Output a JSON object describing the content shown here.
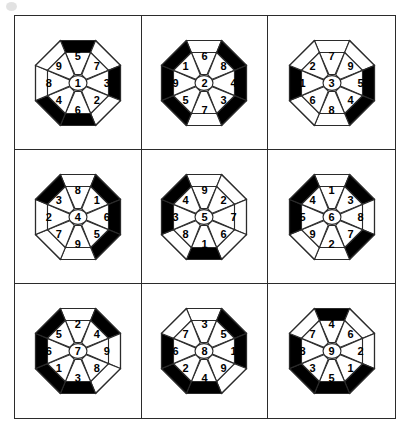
{
  "figure": {
    "title": "",
    "type": "octagon-number-grid",
    "background_color": "#ffffff",
    "line_color": "#2b2b2b",
    "fill_black": "#000000",
    "fill_white": "#ffffff",
    "grid": {
      "rows": 3,
      "columns": 3
    },
    "directions": [
      "N",
      "NE",
      "E",
      "SE",
      "S",
      "SW",
      "W",
      "NW"
    ]
  },
  "cells": [
    {
      "id": "cell-1",
      "row": 1,
      "column": 1,
      "center": "1",
      "ring": {
        "N": "5",
        "NE": "7",
        "E": "3",
        "SE": "2",
        "S": "6",
        "SW": "4",
        "W": "8",
        "NW": "9"
      },
      "black_edges": [
        "N",
        "E",
        "SW",
        "S"
      ]
    },
    {
      "id": "cell-2",
      "row": 1,
      "column": 2,
      "center": "2",
      "ring": {
        "N": "6",
        "NE": "8",
        "E": "4",
        "SE": "3",
        "S": "7",
        "SW": "5",
        "W": "9",
        "NW": "1"
      },
      "black_edges": [
        "NW",
        "NE",
        "E",
        "SE",
        "SW",
        "W"
      ]
    },
    {
      "id": "cell-3",
      "row": 1,
      "column": 3,
      "center": "3",
      "ring": {
        "N": "7",
        "NE": "9",
        "E": "5",
        "SE": "4",
        "S": "8",
        "SW": "6",
        "W": "1",
        "NW": "2"
      },
      "black_edges": [
        "W",
        "E",
        "SE"
      ]
    },
    {
      "id": "cell-4",
      "row": 2,
      "column": 1,
      "center": "4",
      "ring": {
        "N": "8",
        "NE": "1",
        "E": "6",
        "SE": "5",
        "S": "9",
        "SW": "7",
        "W": "2",
        "NW": "3"
      },
      "black_edges": [
        "NW",
        "NE",
        "E",
        "SE"
      ]
    },
    {
      "id": "cell-5",
      "row": 2,
      "column": 2,
      "center": "5",
      "ring": {
        "N": "9",
        "NE": "2",
        "E": "7",
        "SE": "6",
        "S": "1",
        "SW": "8",
        "W": "3",
        "NW": "4"
      },
      "black_edges": [
        "NW",
        "W",
        "S"
      ]
    },
    {
      "id": "cell-6",
      "row": 2,
      "column": 3,
      "center": "6",
      "ring": {
        "N": "1",
        "NE": "3",
        "E": "8",
        "SE": "7",
        "S": "2",
        "SW": "9",
        "W": "5",
        "NW": "4"
      },
      "black_edges": [
        "NW",
        "NE",
        "W",
        "SE"
      ]
    },
    {
      "id": "cell-7",
      "row": 3,
      "column": 1,
      "center": "7",
      "ring": {
        "N": "2",
        "NE": "4",
        "E": "9",
        "SE": "8",
        "S": "3",
        "SW": "1",
        "W": "6",
        "NW": "5"
      },
      "black_edges": [
        "NW",
        "NE",
        "W",
        "SW",
        "S"
      ]
    },
    {
      "id": "cell-8",
      "row": 3,
      "column": 2,
      "center": "8",
      "ring": {
        "N": "3",
        "NE": "5",
        "E": "1",
        "SE": "9",
        "S": "4",
        "SW": "2",
        "W": "6",
        "NW": "7"
      },
      "black_edges": [
        "NE",
        "E",
        "W",
        "SW",
        "S"
      ]
    },
    {
      "id": "cell-9",
      "row": 3,
      "column": 3,
      "center": "9",
      "ring": {
        "N": "4",
        "NE": "6",
        "E": "2",
        "SE": "1",
        "S": "5",
        "SW": "3",
        "W": "8",
        "NW": "7"
      },
      "black_edges": [
        "N",
        "W",
        "SW",
        "S",
        "SE"
      ]
    }
  ]
}
